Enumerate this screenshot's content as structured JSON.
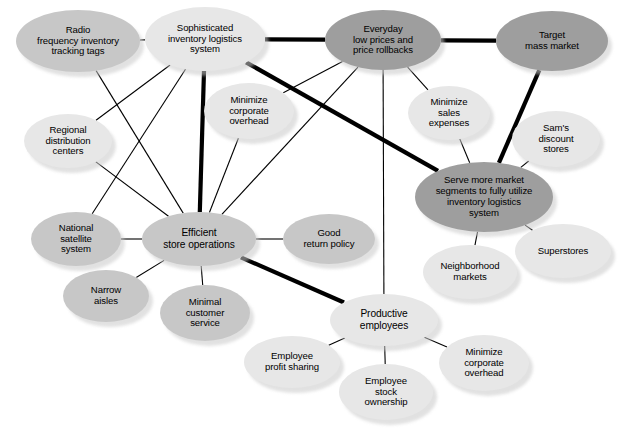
{
  "diagram": {
    "type": "node-link network",
    "palette": {
      "light": "#e7e7e7",
      "medium": "#c7c7c7",
      "dark": "#9e9e9e",
      "edge": "#000000",
      "background": "#ffffff"
    },
    "legend_note": "Darker ellipses are higher-order strategic themes; thick links are primary relationships.",
    "nodes": [
      {
        "id": "radio",
        "label": "Radio\nfrequency inventory\ntracking tags",
        "shade": "medium",
        "cx": 78,
        "cy": 41,
        "rx": 62,
        "ry": 31,
        "fs": 9.6
      },
      {
        "id": "sophisticated",
        "label": "Sophisticated\ninventory logistics\nsystem",
        "shade": "light",
        "cx": 205,
        "cy": 39,
        "rx": 60,
        "ry": 32,
        "fs": 9.6
      },
      {
        "id": "everyday",
        "label": "Everyday\nlow prices and\nprice rollbacks",
        "shade": "dark",
        "cx": 383,
        "cy": 40,
        "rx": 58,
        "ry": 30,
        "fs": 9.6
      },
      {
        "id": "target",
        "label": "Target\nmass market",
        "shade": "dark",
        "cx": 552,
        "cy": 41,
        "rx": 56,
        "ry": 30,
        "fs": 9.6
      },
      {
        "id": "mco_top",
        "label": "Minimize\ncorporate\noverhead",
        "shade": "light",
        "cx": 249,
        "cy": 111,
        "rx": 45,
        "ry": 28,
        "fs": 9.6
      },
      {
        "id": "msales",
        "label": "Minimize\nsales\nexpenses",
        "shade": "light",
        "cx": 449,
        "cy": 113,
        "rx": 41,
        "ry": 27,
        "fs": 9.6
      },
      {
        "id": "sams",
        "label": "Sam's\ndiscount\nstores",
        "shade": "light",
        "cx": 556,
        "cy": 139,
        "rx": 44,
        "ry": 28,
        "fs": 9.6
      },
      {
        "id": "regional",
        "label": "Regional\ndistribution\ncenters",
        "shade": "light",
        "cx": 68,
        "cy": 141,
        "rx": 44,
        "ry": 27,
        "fs": 9.6
      },
      {
        "id": "serve",
        "label": "Serve more market\nsegments to fully utilize\ninventory logistics\nsystem",
        "shade": "dark",
        "cx": 484,
        "cy": 197,
        "rx": 69,
        "ry": 35,
        "fs": 9.6
      },
      {
        "id": "national",
        "label": "National\nsatellite\nsystem",
        "shade": "medium",
        "cx": 76,
        "cy": 239,
        "rx": 45,
        "ry": 27,
        "fs": 9.6
      },
      {
        "id": "efficient",
        "label": "Efficient\nstore operations",
        "shade": "medium",
        "cx": 199,
        "cy": 239,
        "rx": 57,
        "ry": 27,
        "fs": 10.2
      },
      {
        "id": "goodreturn",
        "label": "Good\nreturn policy",
        "shade": "medium",
        "cx": 329,
        "cy": 239,
        "rx": 46,
        "ry": 25,
        "fs": 9.6
      },
      {
        "id": "superstores",
        "label": "Superstores",
        "shade": "light",
        "cx": 563,
        "cy": 251,
        "rx": 48,
        "ry": 27,
        "fs": 9.6
      },
      {
        "id": "neighborhood",
        "label": "Neighborhood\nmarkets",
        "shade": "light",
        "cx": 470,
        "cy": 272,
        "rx": 47,
        "ry": 27,
        "fs": 9.6
      },
      {
        "id": "narrow",
        "label": "Narrow\naisles",
        "shade": "medium",
        "cx": 106,
        "cy": 296,
        "rx": 43,
        "ry": 26,
        "fs": 9.6
      },
      {
        "id": "minimal",
        "label": "Minimal\ncustomer\nservice",
        "shade": "medium",
        "cx": 205,
        "cy": 313,
        "rx": 45,
        "ry": 28,
        "fs": 9.6
      },
      {
        "id": "productive",
        "label": "Productive\nemployees",
        "shade": "light",
        "cx": 384,
        "cy": 320,
        "rx": 54,
        "ry": 26,
        "fs": 10.2
      },
      {
        "id": "profit",
        "label": "Employee\nprofit sharing",
        "shade": "light",
        "cx": 292,
        "cy": 362,
        "rx": 48,
        "ry": 26,
        "fs": 9.6
      },
      {
        "id": "stock",
        "label": "Employee\nstock\nownership",
        "shade": "light",
        "cx": 386,
        "cy": 392,
        "rx": 47,
        "ry": 28,
        "fs": 9.6
      },
      {
        "id": "mco_bot",
        "label": "Minimize\ncorporate\noverhead",
        "shade": "light",
        "cx": 484,
        "cy": 363,
        "rx": 45,
        "ry": 28,
        "fs": 9.6
      }
    ],
    "edges": [
      {
        "from": "radio",
        "to": "sophisticated",
        "weight": "thin"
      },
      {
        "from": "sophisticated",
        "to": "everyday",
        "weight": "thick"
      },
      {
        "from": "everyday",
        "to": "target",
        "weight": "thick"
      },
      {
        "from": "sophisticated",
        "to": "serve",
        "weight": "thick"
      },
      {
        "from": "target",
        "to": "serve",
        "weight": "thick"
      },
      {
        "from": "sophisticated",
        "to": "efficient",
        "weight": "thick"
      },
      {
        "from": "efficient",
        "to": "productive",
        "weight": "thick"
      },
      {
        "from": "radio",
        "to": "efficient",
        "weight": "thin"
      },
      {
        "from": "regional",
        "to": "efficient",
        "weight": "thin"
      },
      {
        "from": "sophisticated",
        "to": "regional",
        "weight": "thin"
      },
      {
        "from": "sophisticated",
        "to": "national",
        "weight": "thin"
      },
      {
        "from": "mco_top",
        "to": "efficient",
        "weight": "thin"
      },
      {
        "from": "everyday",
        "to": "efficient",
        "weight": "thin"
      },
      {
        "from": "everyday",
        "to": "mco_top",
        "weight": "thin"
      },
      {
        "from": "everyday",
        "to": "msales",
        "weight": "thin"
      },
      {
        "from": "everyday",
        "to": "productive",
        "weight": "thin"
      },
      {
        "from": "msales",
        "to": "serve",
        "weight": "thin"
      },
      {
        "from": "sams",
        "to": "serve",
        "weight": "thin"
      },
      {
        "from": "serve",
        "to": "superstores",
        "weight": "thin"
      },
      {
        "from": "serve",
        "to": "neighborhood",
        "weight": "thin"
      },
      {
        "from": "national",
        "to": "efficient",
        "weight": "thin"
      },
      {
        "from": "efficient",
        "to": "goodreturn",
        "weight": "thin"
      },
      {
        "from": "efficient",
        "to": "narrow",
        "weight": "thin"
      },
      {
        "from": "efficient",
        "to": "minimal",
        "weight": "thin"
      },
      {
        "from": "productive",
        "to": "profit",
        "weight": "thin"
      },
      {
        "from": "productive",
        "to": "stock",
        "weight": "thin"
      },
      {
        "from": "productive",
        "to": "mco_bot",
        "weight": "thin"
      }
    ]
  }
}
